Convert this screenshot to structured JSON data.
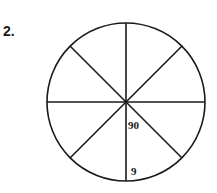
{
  "problem": {
    "number": "2."
  },
  "diagram": {
    "shape": "circle divided into 8 equal sectors",
    "labels": {
      "angle": "90",
      "radius": "9"
    },
    "colors": {
      "stroke": "#1a1a1a",
      "background": "#ffffff"
    }
  }
}
